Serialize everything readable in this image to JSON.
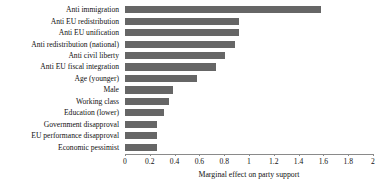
{
  "chart_data": {
    "type": "bar",
    "orientation": "horizontal",
    "title": "",
    "xlabel": "Marginal effect on party support",
    "ylabel": "",
    "xlim": [
      0,
      2
    ],
    "xticks": [
      0,
      0.2,
      0.4,
      0.6,
      0.8,
      1,
      1.2,
      1.4,
      1.6,
      1.8,
      2
    ],
    "xtick_labels": [
      "0",
      "0.2",
      "0.4",
      "0.6",
      "0.8",
      "1",
      "1.2",
      "1.4",
      "1.6",
      "1.8",
      "2"
    ],
    "grid": false,
    "legend": null,
    "bar_color": "#666666",
    "categories": [
      "Anti immigration",
      "Anti EU redistribution",
      "Anti EU unification",
      "Anti redistribution (national)",
      "Anti civil liberty",
      "Anti EU fiscal integration",
      "Age (younger)",
      "Male",
      "Working class",
      "Education (lower)",
      "Government disapproval",
      "EU performance disapproval",
      "Economic pessimist"
    ],
    "values": [
      1.58,
      0.92,
      0.92,
      0.89,
      0.81,
      0.73,
      0.58,
      0.39,
      0.355,
      0.315,
      0.26,
      0.26,
      0.26
    ]
  }
}
